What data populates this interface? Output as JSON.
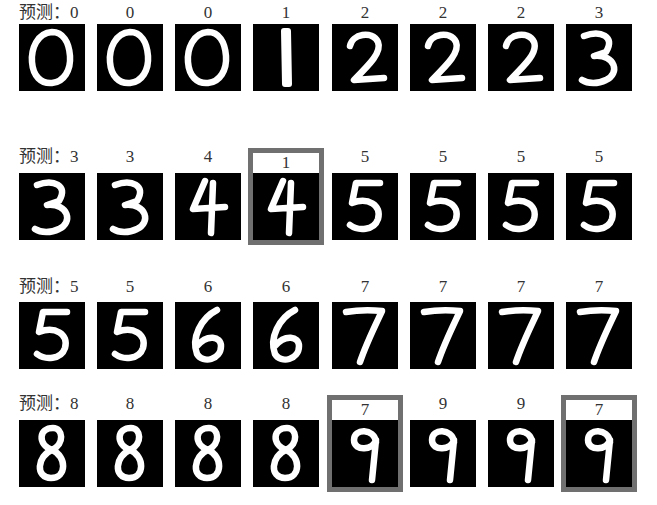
{
  "prefix": "预测：",
  "rows": [
    {
      "cells": [
        {
          "pred": "0",
          "digit": "0",
          "wrong": false
        },
        {
          "pred": "0",
          "digit": "0",
          "wrong": false
        },
        {
          "pred": "0",
          "digit": "0",
          "wrong": false
        },
        {
          "pred": "1",
          "digit": "1",
          "wrong": false
        },
        {
          "pred": "2",
          "digit": "2",
          "wrong": false
        },
        {
          "pred": "2",
          "digit": "2",
          "wrong": false
        },
        {
          "pred": "2",
          "digit": "2",
          "wrong": false
        },
        {
          "pred": "3",
          "digit": "3",
          "wrong": false
        }
      ]
    },
    {
      "cells": [
        {
          "pred": "3",
          "digit": "3",
          "wrong": false
        },
        {
          "pred": "3",
          "digit": "3",
          "wrong": false
        },
        {
          "pred": "4",
          "digit": "4",
          "wrong": false
        },
        {
          "pred": "1",
          "digit": "4",
          "wrong": true
        },
        {
          "pred": "5",
          "digit": "5",
          "wrong": false
        },
        {
          "pred": "5",
          "digit": "5",
          "wrong": false
        },
        {
          "pred": "5",
          "digit": "5",
          "wrong": false
        },
        {
          "pred": "5",
          "digit": "5",
          "wrong": false
        }
      ]
    },
    {
      "cells": [
        {
          "pred": "5",
          "digit": "5",
          "wrong": false
        },
        {
          "pred": "5",
          "digit": "5",
          "wrong": false
        },
        {
          "pred": "6",
          "digit": "6",
          "wrong": false
        },
        {
          "pred": "6",
          "digit": "6",
          "wrong": false
        },
        {
          "pred": "7",
          "digit": "7",
          "wrong": false
        },
        {
          "pred": "7",
          "digit": "7",
          "wrong": false
        },
        {
          "pred": "7",
          "digit": "7",
          "wrong": false
        },
        {
          "pred": "7",
          "digit": "7",
          "wrong": false
        }
      ]
    },
    {
      "cells": [
        {
          "pred": "8",
          "digit": "8",
          "wrong": false
        },
        {
          "pred": "8",
          "digit": "8",
          "wrong": false
        },
        {
          "pred": "8",
          "digit": "8",
          "wrong": false
        },
        {
          "pred": "8",
          "digit": "8",
          "wrong": false
        },
        {
          "pred": "7",
          "digit": "9",
          "wrong": true
        },
        {
          "pred": "9",
          "digit": "9",
          "wrong": false
        },
        {
          "pred": "9",
          "digit": "9",
          "wrong": false
        },
        {
          "pred": "7",
          "digit": "9",
          "wrong": true
        }
      ]
    }
  ],
  "colors": {
    "tile_bg": "#000000",
    "stroke": "#ffffff",
    "error_frame": "#707070",
    "text": "#333333"
  }
}
